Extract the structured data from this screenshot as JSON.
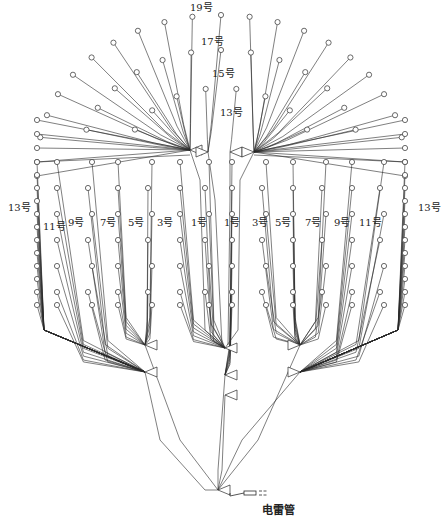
{
  "diagram": {
    "title": "",
    "colors": {
      "line": "#2a2a2a",
      "hole": "#444444",
      "bg": "#ffffff"
    },
    "labels": [
      {
        "id": "lbl-19",
        "text": "19号",
        "x": 190,
        "y": 3
      },
      {
        "id": "lbl-17",
        "text": "17号",
        "x": 201,
        "y": 37
      },
      {
        "id": "lbl-15",
        "text": "15号",
        "x": 212,
        "y": 69
      },
      {
        "id": "lbl-13-top",
        "text": "13号",
        "x": 220,
        "y": 108
      },
      {
        "id": "lbl-13-left",
        "text": "13号",
        "x": 8,
        "y": 203
      },
      {
        "id": "lbl-11-left",
        "text": "11号",
        "x": 43,
        "y": 222
      },
      {
        "id": "lbl-9-left",
        "text": "9号",
        "x": 68,
        "y": 218
      },
      {
        "id": "lbl-7-left",
        "text": "7号",
        "x": 100,
        "y": 218
      },
      {
        "id": "lbl-5-left",
        "text": "5号",
        "x": 128,
        "y": 218
      },
      {
        "id": "lbl-3-left",
        "text": "3号",
        "x": 157,
        "y": 218
      },
      {
        "id": "lbl-1-left",
        "text": "1号",
        "x": 191,
        "y": 218
      },
      {
        "id": "lbl-1-right",
        "text": "1号",
        "x": 224,
        "y": 218
      },
      {
        "id": "lbl-3-right",
        "text": "3号",
        "x": 252,
        "y": 218
      },
      {
        "id": "lbl-5-right",
        "text": "5号",
        "x": 275,
        "y": 218
      },
      {
        "id": "lbl-7-right",
        "text": "7号",
        "x": 305,
        "y": 218
      },
      {
        "id": "lbl-9-right",
        "text": "9号",
        "x": 334,
        "y": 218
      },
      {
        "id": "lbl-11-right",
        "text": "11号",
        "x": 359,
        "y": 218
      },
      {
        "id": "lbl-13-right",
        "text": "13号",
        "x": 418,
        "y": 203
      }
    ],
    "detonator_label": {
      "text": "电雷管",
      "x": 262,
      "y": 505
    },
    "junctions": {
      "top_left": [
        190,
        150
      ],
      "top_mid_left": [
        208,
        152
      ],
      "top_mid_right": [
        230,
        152
      ],
      "top_right": [
        254,
        152
      ],
      "mid_left_1": [
        145,
        345
      ],
      "mid_left_2": [
        145,
        372
      ],
      "mid_right_1": [
        300,
        345
      ],
      "mid_right_2": [
        300,
        372
      ],
      "center_1": [
        225,
        348
      ],
      "center_2": [
        225,
        375
      ],
      "center_3": [
        225,
        395
      ],
      "final": [
        218,
        490
      ]
    },
    "detonator": {
      "x1": 232,
      "y1": 493,
      "x2": 268,
      "y2": 493
    }
  }
}
